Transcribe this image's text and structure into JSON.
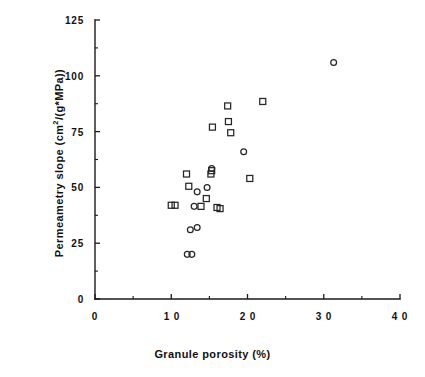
{
  "chart_data": {
    "type": "scatter",
    "title": "",
    "xlabel": "Granule porosity (%)",
    "ylabel": "Permeametry slope  (cm2/(g*MPa))",
    "ylabel_parts": {
      "prefix": "Permeametry  slope   (cm",
      "superscript": "2",
      "suffix": "/(g*MPa))"
    },
    "xlim": [
      0,
      40
    ],
    "ylim": [
      0,
      125
    ],
    "xticks": [
      0,
      10,
      20,
      30,
      40
    ],
    "yticks": [
      0,
      25,
      50,
      75,
      100,
      125
    ],
    "xtick_labels": [
      "0",
      "1 0",
      "2 0",
      "3 0",
      "4 0"
    ],
    "ytick_labels": [
      "0",
      "25",
      "50",
      "75",
      "100",
      "125"
    ],
    "x_minor_interval": 5,
    "y_minor_interval": 12.5,
    "grid": false,
    "legend": false,
    "legend_position": "none",
    "marker_colors": {
      "square": "#262626",
      "circle": "#262626",
      "axis": "#1a1a1a",
      "background": "#ffffff"
    },
    "series": [
      {
        "name": "open-square",
        "marker": "square",
        "points": [
          [
            10.0,
            42.0
          ],
          [
            10.5,
            42.0
          ],
          [
            12.0,
            56.0
          ],
          [
            12.3,
            50.5
          ],
          [
            13.9,
            41.5
          ],
          [
            14.6,
            45.0
          ],
          [
            15.2,
            56.0
          ],
          [
            15.3,
            57.5
          ],
          [
            15.4,
            77.0
          ],
          [
            16.0,
            41.0
          ],
          [
            16.4,
            40.5
          ],
          [
            17.4,
            86.5
          ],
          [
            17.5,
            79.5
          ],
          [
            17.8,
            74.5
          ],
          [
            20.3,
            54.0
          ],
          [
            22.0,
            88.5
          ]
        ]
      },
      {
        "name": "open-circle",
        "marker": "circle",
        "points": [
          [
            12.1,
            20.0
          ],
          [
            12.7,
            20.0
          ],
          [
            12.5,
            31.0
          ],
          [
            13.4,
            32.0
          ],
          [
            13.0,
            41.5
          ],
          [
            13.4,
            48.0
          ],
          [
            14.7,
            50.0
          ],
          [
            15.3,
            58.5
          ],
          [
            19.5,
            66.0
          ],
          [
            31.3,
            106.0
          ]
        ]
      }
    ]
  },
  "plot_geometry": {
    "origin_x_px": 95,
    "origin_y_px": 299,
    "x_scale_px_per_unit": 7.625,
    "y_scale_px_per_unit": 2.232,
    "tick_major_len": 5,
    "tick_minor_len": 3
  }
}
